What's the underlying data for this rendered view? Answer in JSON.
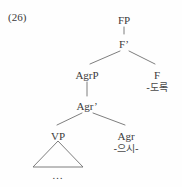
{
  "example": {
    "number_label": "(26)"
  },
  "tree": {
    "nodes": [
      {
        "id": "FP",
        "label": "FP",
        "morph": "",
        "x": 124,
        "y": 14
      },
      {
        "id": "Fbar",
        "label": "F’",
        "morph": "",
        "x": 124,
        "y": 38
      },
      {
        "id": "AgrP",
        "label": "AgrP",
        "morph": "",
        "x": 87,
        "y": 69
      },
      {
        "id": "F",
        "label": "F",
        "morph": "-도록",
        "x": 157,
        "y": 69
      },
      {
        "id": "Agrbar",
        "label": "Agr’",
        "morph": "",
        "x": 87,
        "y": 100
      },
      {
        "id": "VP",
        "label": "VP",
        "morph": "",
        "x": 58,
        "y": 130
      },
      {
        "id": "Agr",
        "label": "Agr",
        "morph": "-으시-",
        "x": 126,
        "y": 130
      }
    ],
    "edges": [
      {
        "from": "FP",
        "to": "Fbar",
        "x1": 124,
        "y1": 27,
        "x2": 124,
        "y2": 34
      },
      {
        "from": "Fbar",
        "to": "AgrP",
        "x1": 120,
        "y1": 51,
        "x2": 90,
        "y2": 64
      },
      {
        "from": "Fbar",
        "to": "F",
        "x1": 129,
        "y1": 51,
        "x2": 155,
        "y2": 64
      },
      {
        "from": "AgrP",
        "to": "Agrbar",
        "x1": 87,
        "y1": 82,
        "x2": 87,
        "y2": 96
      },
      {
        "from": "Agrbar",
        "to": "VP",
        "x1": 82,
        "y1": 113,
        "x2": 57,
        "y2": 125
      },
      {
        "from": "Agrbar",
        "to": "Agr",
        "x1": 93,
        "y1": 113,
        "x2": 125,
        "y2": 125
      }
    ],
    "triangle": {
      "name": "vp-triangle",
      "apex_x": 58,
      "apex_y": 141,
      "left_x": 33,
      "left_y": 167,
      "right_x": 83,
      "right_y": 167
    },
    "ellipsis_label": "…",
    "line_color": "#6f6f6f",
    "text_color": "#3b3b3b"
  }
}
